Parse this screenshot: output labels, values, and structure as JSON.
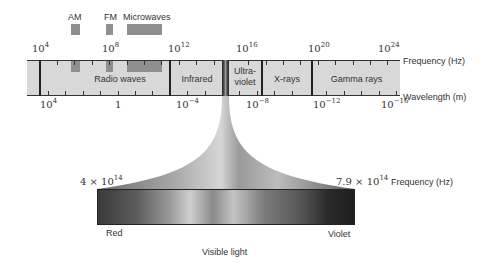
{
  "sub_bands": [
    {
      "label": "AM"
    },
    {
      "label": "FM"
    },
    {
      "label": "Microwaves"
    }
  ],
  "frequency_axis": {
    "label": "Frequency (Hz)",
    "ticks": [
      {
        "base": "10",
        "exp": "4"
      },
      {
        "base": "10",
        "exp": "8"
      },
      {
        "base": "10",
        "exp": "12"
      },
      {
        "base": "10",
        "exp": "16"
      },
      {
        "base": "10",
        "exp": "20"
      },
      {
        "base": "10",
        "exp": "24"
      }
    ]
  },
  "wavelength_axis": {
    "label": "Wavelength (m)",
    "ticks": [
      {
        "base": "10",
        "exp": "4"
      },
      {
        "base": "1",
        "exp": ""
      },
      {
        "base": "10",
        "exp": "−4"
      },
      {
        "base": "10",
        "exp": "−8"
      },
      {
        "base": "10",
        "exp": "−12"
      },
      {
        "base": "10",
        "exp": "−16"
      }
    ]
  },
  "regions": [
    {
      "label": "Radio waves"
    },
    {
      "label": "Infrared"
    },
    {
      "label_line1": "Ultra-",
      "label_line2": "violet"
    },
    {
      "label": "X-rays"
    },
    {
      "label": "Gamma rays"
    }
  ],
  "visible": {
    "low_freq": {
      "mantissa": "4 × 10",
      "exp": "14"
    },
    "high_freq": {
      "mantissa": "7.9 × 10",
      "exp": "14"
    },
    "freq_label": "Frequency (Hz)",
    "left_label": "Red",
    "right_label": "Violet",
    "caption": "Visible light"
  },
  "colors": {
    "band_fill": "#d8d8d8",
    "sub_band_fill": "#8f8f8f",
    "line": "#222222"
  }
}
